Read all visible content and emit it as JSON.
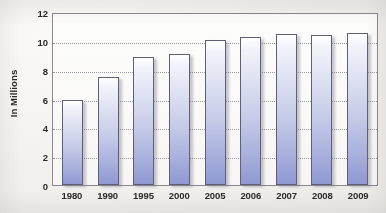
{
  "chart_data": {
    "type": "bar",
    "title": "",
    "subtitle": "",
    "xlabel": "",
    "ylabel": "In Millions",
    "categories": [
      "1980",
      "1990",
      "1995",
      "2000",
      "2005",
      "2006",
      "2007",
      "2008",
      "2009"
    ],
    "values": [
      6.0,
      7.6,
      9.0,
      9.2,
      10.2,
      10.4,
      10.6,
      10.5,
      10.7
    ],
    "series": [
      {
        "name": "",
        "values": [
          6.0,
          7.6,
          9.0,
          9.2,
          10.2,
          10.4,
          10.6,
          10.5,
          10.7
        ]
      }
    ],
    "ylim": [
      0,
      12
    ],
    "ytick_labels": [
      "0",
      "2",
      "4",
      "6",
      "8",
      "10",
      "12"
    ],
    "ytick_values": [
      0,
      2,
      4,
      6,
      8,
      10,
      12
    ],
    "grid": "horizontal-dotted",
    "legend": "none",
    "annotations": []
  },
  "colors": {
    "bar_top": "#ffffff",
    "bar_bottom": "#8f98d1",
    "bar_outline": "#5f5f78",
    "gridline": "#9a9aa2",
    "axis_line": "#8a8a90",
    "text": "#2b2b2b",
    "background": "#f4f3f1"
  }
}
